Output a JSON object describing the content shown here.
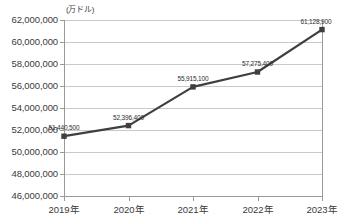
{
  "chart_data": {
    "type": "line",
    "title": "",
    "unit_label": "(万ドル)",
    "xlabel": "",
    "ylabel": "",
    "categories": [
      "2019年",
      "2020年",
      "2021年",
      "2022年",
      "2023年"
    ],
    "values": [
      51440500,
      52396400,
      55915100,
      57275400,
      61128900
    ],
    "point_labels": [
      "51,440,500",
      "52,396,400",
      "55,915,100",
      "57,275,400",
      "61,128,900"
    ],
    "ylim": [
      46000000,
      62000000
    ],
    "ytick_step": 2000000,
    "ytick_labels": [
      "62,000,000",
      "60,000,000",
      "58,000,000",
      "56,000,000",
      "54,000,000",
      "52,000,000",
      "50,000,000",
      "48,000,000",
      "46,000,000"
    ],
    "ytick_values": [
      62000000,
      60000000,
      58000000,
      56000000,
      54000000,
      52000000,
      50000000,
      48000000,
      46000000
    ],
    "grid": true,
    "legend": "none",
    "series_color": "#3f3f3f",
    "marker": "square",
    "grid_color": "#c9c9c9",
    "axis_color": "#9a9a9a"
  }
}
